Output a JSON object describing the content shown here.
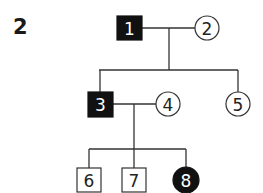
{
  "figure": {
    "label": "2",
    "type": "pedigree chart"
  },
  "individuals": [
    {
      "id": "1",
      "sex": "male",
      "affected": true,
      "generation": 1
    },
    {
      "id": "2",
      "sex": "female",
      "affected": false,
      "generation": 1
    },
    {
      "id": "3",
      "sex": "male",
      "affected": true,
      "generation": 2
    },
    {
      "id": "4",
      "sex": "female",
      "affected": false,
      "generation": 2
    },
    {
      "id": "5",
      "sex": "female",
      "affected": false,
      "generation": 2
    },
    {
      "id": "6",
      "sex": "male",
      "affected": false,
      "generation": 3
    },
    {
      "id": "7",
      "sex": "male",
      "affected": false,
      "generation": 3
    },
    {
      "id": "8",
      "sex": "female",
      "affected": true,
      "generation": 3
    }
  ],
  "relationships": [
    {
      "couple": [
        "1",
        "2"
      ],
      "children": [
        "3",
        "5"
      ]
    },
    {
      "couple": [
        "3",
        "4"
      ],
      "children": [
        "6",
        "7",
        "8"
      ]
    }
  ],
  "colors": {
    "affected": "#111111",
    "unaffected": "#ffffff",
    "line": "#333333"
  }
}
